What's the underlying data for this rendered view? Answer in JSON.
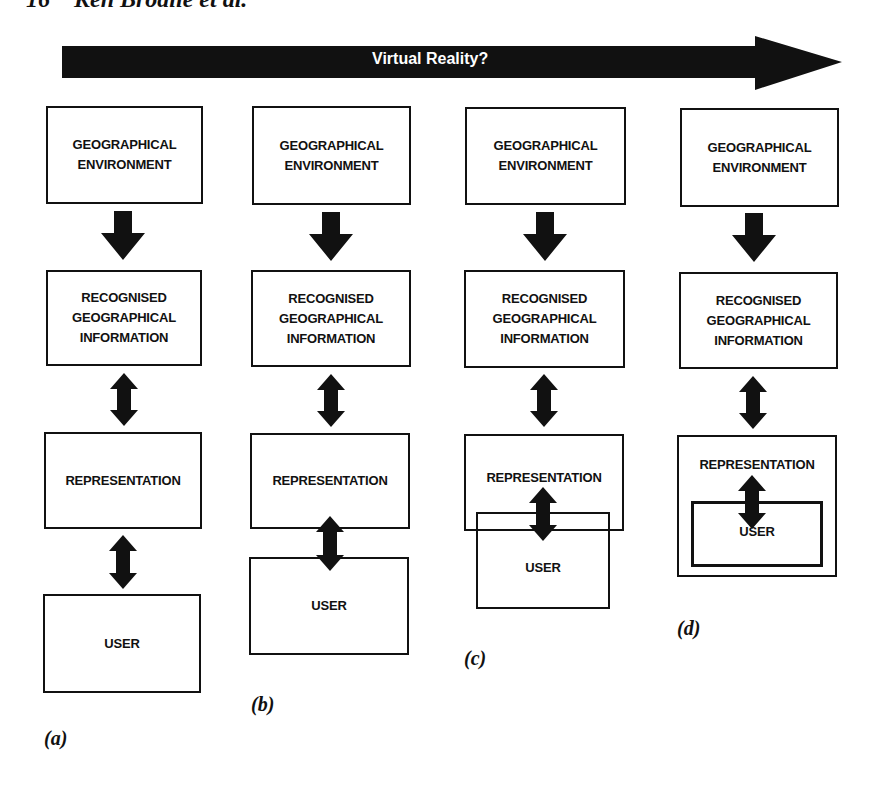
{
  "header": {
    "page_number": "16",
    "running_title": "Ken Brodlie et al."
  },
  "timeline_arrow": {
    "label": "Virtual Reality?",
    "color": "#111111"
  },
  "boxes": {
    "geo_env": "GEOGRAPHICAL\nENVIRONMENT",
    "recognised": "RECOGNISED\nGEOGRAPHICAL\nINFORMATION",
    "representation": "REPRESENTATION",
    "user": "USER"
  },
  "panels": [
    {
      "id": "a",
      "label": "(a)",
      "description": "User separate from representation"
    },
    {
      "id": "b",
      "label": "(b)",
      "description": "User adjacent to representation"
    },
    {
      "id": "c",
      "label": "(c)",
      "description": "User overlaps representation"
    },
    {
      "id": "d",
      "label": "(d)",
      "description": "User immersed inside representation"
    }
  ]
}
